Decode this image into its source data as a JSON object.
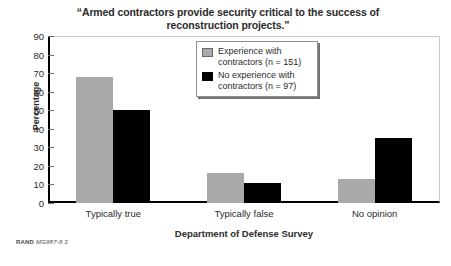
{
  "chart_data": {
    "type": "bar",
    "title": "“Armed contractors provide security critical to the success of reconstruction projects.”",
    "xlabel": "Department of Defense Survey",
    "ylabel": "Percentage",
    "categories": [
      "Typically true",
      "Typically false",
      "No opinion"
    ],
    "series": [
      {
        "name": "Experience with contractors (n = 151)",
        "color": "#a9a9a9",
        "values": [
          68,
          16,
          13
        ]
      },
      {
        "name": "No experience with contractors (n = 97)",
        "color": "#000000",
        "values": [
          50,
          11,
          35
        ]
      }
    ],
    "ylim": [
      0,
      90
    ],
    "ytick_step": 10,
    "yticks": [
      0,
      10,
      20,
      30,
      40,
      50,
      60,
      70,
      80,
      90
    ],
    "grid": false,
    "legend_position": "top-center"
  },
  "legend": {
    "entries": [
      {
        "label_line1": "Experience with",
        "label_line2": "contractors (n = 151)"
      },
      {
        "label_line1": "No experience with",
        "label_line2": "contractors (n = 97)"
      }
    ]
  },
  "footer": {
    "prefix": "RAND",
    "figure_id": "MG987-8.3"
  }
}
